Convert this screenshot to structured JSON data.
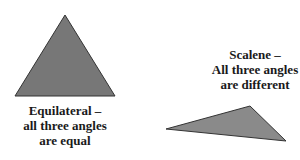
{
  "diagram": {
    "triangles": [
      {
        "type": "equilateral",
        "fill": "#777777",
        "stroke": "#333333",
        "points": [
          [
            65,
            15
          ],
          [
            15,
            96
          ],
          [
            115,
            96
          ]
        ],
        "label_lines": [
          "Equilateral –",
          "all three angles",
          "are equal"
        ]
      },
      {
        "type": "scalene",
        "fill": "#8a8a8a",
        "stroke": "#333333",
        "points": [
          [
            166,
            129
          ],
          [
            250,
            106
          ],
          [
            286,
            141
          ]
        ],
        "label_lines": [
          "Scalene –",
          "All three angles",
          "are different"
        ]
      }
    ]
  }
}
